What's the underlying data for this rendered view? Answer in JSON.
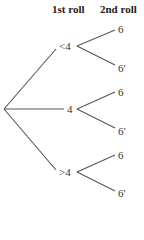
{
  "headers": {
    "first": "1st roll",
    "second": "2nd roll"
  },
  "tree": {
    "branches": [
      {
        "label": "<4",
        "children": [
          {
            "label": "6"
          },
          {
            "label": "6′"
          }
        ]
      },
      {
        "label": "4",
        "children": [
          {
            "label": "6"
          },
          {
            "label": "6′"
          }
        ]
      },
      {
        "label": ">4",
        "children": [
          {
            "label": "6"
          },
          {
            "label": "6′"
          }
        ]
      }
    ]
  }
}
